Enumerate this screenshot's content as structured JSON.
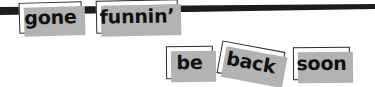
{
  "scene": {
    "width": 375,
    "height": 87,
    "background_color": "#ffffff",
    "description_alt": "gone funnin' be back soon"
  },
  "rule": {
    "name": "horizontal-rule",
    "color": "#1c1c1c",
    "left_thickness_px": 8,
    "right_thickness_px": 5,
    "y_left_px": 7,
    "y_right_px": 4
  },
  "card_style": {
    "fill_color": "#ffffff",
    "border_color": "#2b2b2b",
    "shadow_color": "#b3b3b3",
    "shadow_offset_px": 4,
    "text_color": "#111111"
  },
  "cards": [
    {
      "id": "gone",
      "label": "gone",
      "row": 1,
      "rotation_deg": -1.6
    },
    {
      "id": "funnin",
      "label": "funnin’",
      "row": 1,
      "rotation_deg": -1.2
    },
    {
      "id": "be",
      "label": "be",
      "row": 2,
      "rotation_deg": -0.6
    },
    {
      "id": "back",
      "label": "back",
      "row": 2,
      "rotation_deg": 10.5
    },
    {
      "id": "soon",
      "label": "soon",
      "row": 2,
      "rotation_deg": -0.4
    }
  ],
  "phrase": {
    "line_1": "gone funnin’",
    "line_2": "be back soon"
  }
}
